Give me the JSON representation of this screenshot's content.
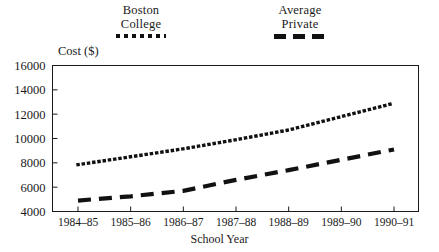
{
  "chart_data": {
    "type": "line",
    "title": "",
    "xlabel": "School Year",
    "ylabel": "Cost ($)",
    "categories": [
      "1984–85",
      "1985–86",
      "1986–87",
      "1987–88",
      "1988–89",
      "1989–90",
      "1990–91"
    ],
    "ylim": [
      4000,
      16000
    ],
    "yticks": [
      4000,
      6000,
      8000,
      10000,
      12000,
      14000,
      16000
    ],
    "ytick_labels": [
      "4000",
      "6000",
      "8000",
      "10000",
      "12000",
      "14000",
      "16000"
    ],
    "grid": false,
    "legend_position": "above-plot",
    "series": [
      {
        "name": "Boston College",
        "legend_line1": "Boston",
        "legend_line2": "College",
        "style": "dotted",
        "color": "#111111",
        "values": [
          7850,
          8500,
          9150,
          9900,
          10700,
          11800,
          12900
        ]
      },
      {
        "name": "Average Private",
        "legend_line1": "Average",
        "legend_line2": "Private",
        "style": "dashed",
        "color": "#111111",
        "values": [
          4900,
          5250,
          5700,
          6600,
          7400,
          8250,
          9100
        ]
      }
    ]
  },
  "axes": {
    "y_axis_title": "Cost ($)",
    "x_axis_title": "School Year"
  }
}
